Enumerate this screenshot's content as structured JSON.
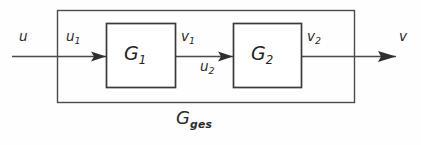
{
  "diagram": {
    "type": "block-diagram",
    "colors": {
      "line": "#4a4a4a",
      "box_stroke": "#3a3a3a",
      "text": "#2a2a2a",
      "background": "#fefefe"
    },
    "blocks": [
      {
        "id": "g1",
        "base": "G",
        "subscript": "1",
        "x": 106,
        "y": 23,
        "width": 70,
        "height": 65
      },
      {
        "id": "g2",
        "base": "G",
        "subscript": "2",
        "x": 233,
        "y": 23,
        "width": 69,
        "height": 65
      }
    ],
    "outer_block": {
      "id": "gges",
      "base": "G",
      "subscript": "ges",
      "x": 57,
      "y": 10,
      "width": 298,
      "height": 93
    },
    "signals": [
      {
        "id": "u",
        "base": "u",
        "subscript": "",
        "position": "input-external"
      },
      {
        "id": "u1",
        "base": "u",
        "subscript": "1",
        "position": "input-g1"
      },
      {
        "id": "v1",
        "base": "v",
        "subscript": "1",
        "position": "output-g1"
      },
      {
        "id": "u2",
        "base": "u",
        "subscript": "2",
        "position": "input-g2"
      },
      {
        "id": "v2",
        "base": "v",
        "subscript": "2",
        "position": "output-g2"
      },
      {
        "id": "v",
        "base": "v",
        "subscript": "",
        "position": "output-external"
      }
    ],
    "signal_line_y": 56,
    "arrows": [
      {
        "id": "arrow-into-g1",
        "x": 106,
        "y": 56
      },
      {
        "id": "arrow-into-g2",
        "x": 233,
        "y": 56
      },
      {
        "id": "arrow-output",
        "x": 395,
        "y": 56
      }
    ]
  }
}
